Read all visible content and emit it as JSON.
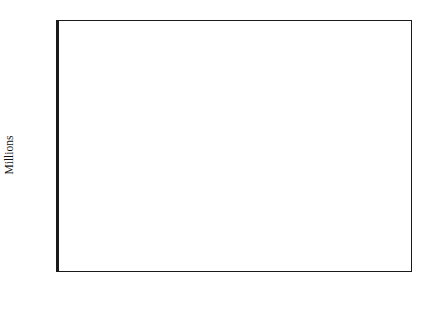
{
  "chart_data": {
    "type": "line",
    "title": "",
    "subtitle": "",
    "xlabel": "",
    "ylabel": "Millions",
    "xlim": [
      1950,
      2020
    ],
    "ylim": [
      0,
      160
    ],
    "grid": false,
    "legend_position": "inline-annotations",
    "x_ticks": [
      1950,
      1960,
      1970,
      1980,
      1990,
      2000,
      2010,
      2020
    ],
    "x_minor_ticks": [
      1955,
      1965,
      1975,
      1985,
      1995,
      2005,
      2015
    ],
    "y_ticks": [
      0,
      20,
      40,
      60,
      80,
      100,
      120,
      140,
      160
    ],
    "x_tick_labels": [
      "1950",
      "1960",
      "1970",
      "1980",
      "1990",
      "2000",
      "2010",
      "2020"
    ],
    "y_tick_labels": [
      "0",
      "20",
      "40",
      "60",
      "80",
      "100",
      "120",
      "140",
      "160"
    ],
    "x": [
      1950,
      1955,
      1960,
      1965,
      1970,
      1975,
      1980,
      1985,
      1990,
      1995,
      2000,
      2005,
      2010,
      2015,
      2020
    ],
    "series": [
      {
        "name": "World",
        "style": "solid",
        "color": "#111111",
        "values": [
          98,
          101,
          103,
          112,
          122,
          120,
          120.5,
          127,
          137,
          139.5,
          141,
          142,
          143,
          142.5,
          141
        ]
      },
      {
        "name": "LDCs",
        "style": "dashed",
        "color": "#111111",
        "values": [
          79,
          82,
          87,
          94,
          101,
          102,
          104,
          110,
          120,
          122,
          122.5,
          123.5,
          124,
          123.5,
          122
        ]
      },
      {
        "name": "MDCs",
        "style": "dashed",
        "color": "#111111",
        "values": [
          19.5,
          19.5,
          19.3,
          19,
          18.5,
          18.3,
          18.2,
          18,
          18,
          18,
          17.8,
          17.8,
          17.7,
          17.6,
          17.5
        ]
      }
    ],
    "annotations": [
      {
        "name": "observation-zone",
        "text": "Observation",
        "x": 1967,
        "y": 152
      },
      {
        "name": "forecast-zone",
        "text": "Forecast",
        "x": 2002,
        "y": 152
      }
    ],
    "series_labels": [
      {
        "name": "World",
        "text": "World",
        "x": 1960.5,
        "y": 130
      },
      {
        "name": "LDCs",
        "text": "LDCs",
        "x": 1961.5,
        "y": 91
      },
      {
        "name": "MDCs",
        "text": "MDCs",
        "x": 1974,
        "y": 28
      }
    ],
    "shaded_region": {
      "name": "forecast-band",
      "start": 1985,
      "end": 2020,
      "color": "#b9b9b9",
      "label": "Forecast"
    },
    "colors": {
      "axis": "#1a1a1a",
      "line": "#111111",
      "forecast_fill": "#b9b9b9",
      "plot_background": "#ffffff"
    }
  }
}
